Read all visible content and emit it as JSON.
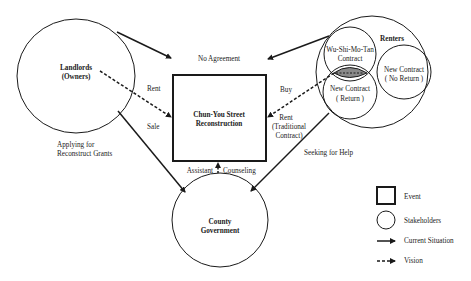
{
  "diagram": {
    "event": {
      "line1": "Chun-You Street",
      "line2": "Reconstruction"
    },
    "stakeholders": {
      "landlords": {
        "line1": "Landlords",
        "line2": "(Owners)"
      },
      "renters": {
        "title": "Renters",
        "wu_shi_mo_tan": {
          "line1": "Wu-Shi-Mo-Tan",
          "line2": "Contract"
        },
        "new_no_return": {
          "line1": "New Contract",
          "line2": "( No Return )"
        },
        "new_return": {
          "line1": "New Contract",
          "line2": "( Return )"
        }
      },
      "county": {
        "line1": "County",
        "line2": "Government"
      }
    },
    "edge_labels": {
      "no_agreement": "No Agreement",
      "rent_left": "Rent",
      "sale": "Sale",
      "buy": "Buy",
      "rent_right_1": "Rent",
      "rent_right_2": "(Traditional",
      "rent_right_3": "Contract)",
      "applying_1": "Applying for",
      "applying_2": "Reconstruct Grants",
      "seeking_help": "Seeking for Help",
      "assistant": "Assistant",
      "counseling": "Counseling"
    },
    "legend": {
      "event": "Event",
      "stakeholders": "Stakeholders",
      "current": "Current Situation",
      "vision": "Vision"
    },
    "colors": {
      "line": "#1a1a1a",
      "overlap_fill": "#8a8a8a",
      "background": "#ffffff"
    }
  }
}
